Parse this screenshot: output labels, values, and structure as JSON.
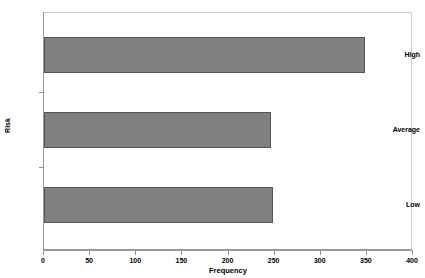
{
  "chart_data": {
    "type": "bar",
    "orientation": "horizontal",
    "title": "",
    "categories": [
      "High",
      "Average",
      "Low"
    ],
    "values": [
      348,
      246,
      248
    ],
    "xlabel": "Frequency",
    "ylabel": "Risk",
    "xlim": [
      0,
      400
    ],
    "xticks": [
      0,
      50,
      100,
      150,
      200,
      250,
      300,
      350,
      400
    ],
    "xtick_labels": [
      "0",
      "50",
      "100",
      "150",
      "200",
      "250",
      "300",
      "350",
      "400"
    ],
    "grid": false,
    "legend": false,
    "bar_color": "#808080",
    "bar_edge_color": "#555555",
    "frame_color": "#cfcfcf",
    "axis_color": "#9a9a9a"
  }
}
